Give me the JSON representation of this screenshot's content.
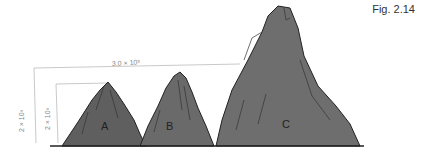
{
  "figure": {
    "label": "Fig. 2.14"
  },
  "annotations": {
    "width_text": "3.0 × 10³",
    "height_text": "2 × 10³",
    "outer_height_text": "2 × 10³"
  },
  "peaks": [
    {
      "label": "A",
      "color": "#5f5f5f"
    },
    {
      "label": "B",
      "color": "#6a6a6a"
    },
    {
      "label": "C",
      "color": "#6e6e6e"
    }
  ]
}
